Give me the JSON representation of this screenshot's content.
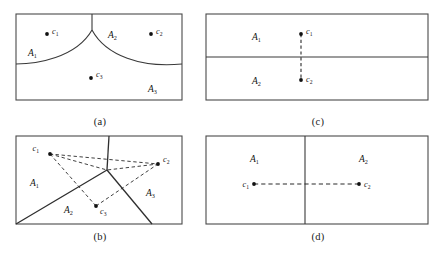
{
  "figure": {
    "type": "multi-panel-diagram",
    "panel_count": 4,
    "stroke_color": "#3a3a3a",
    "dash_color": "#2a2a2a",
    "point_color": "#111111",
    "background": "#ffffff"
  },
  "captions": {
    "a": "(a)",
    "b": "(b)",
    "c": "(c)",
    "d": "(d)"
  },
  "panel_a": {
    "region_labels": [
      {
        "base": "A",
        "sub": "1"
      },
      {
        "base": "A",
        "sub": "2"
      },
      {
        "base": "A",
        "sub": "3"
      }
    ],
    "point_labels": [
      {
        "base": "c",
        "sub": "1"
      },
      {
        "base": "c",
        "sub": "2"
      },
      {
        "base": "c",
        "sub": "3"
      }
    ]
  },
  "panel_b": {
    "region_labels": [
      {
        "base": "A",
        "sub": "1"
      },
      {
        "base": "A",
        "sub": "2"
      },
      {
        "base": "A",
        "sub": "3"
      }
    ],
    "point_labels": [
      {
        "base": "c",
        "sub": "1"
      },
      {
        "base": "c",
        "sub": "2"
      },
      {
        "base": "c",
        "sub": "3"
      }
    ]
  },
  "panel_c": {
    "region_labels": [
      {
        "base": "A",
        "sub": "1"
      },
      {
        "base": "A",
        "sub": "2"
      }
    ],
    "point_labels": [
      {
        "base": "c",
        "sub": "1"
      },
      {
        "base": "c",
        "sub": "2"
      }
    ]
  },
  "panel_d": {
    "region_labels": [
      {
        "base": "A",
        "sub": "1"
      },
      {
        "base": "A",
        "sub": "2"
      }
    ],
    "point_labels": [
      {
        "base": "c",
        "sub": "1"
      },
      {
        "base": "c",
        "sub": "2"
      }
    ]
  }
}
